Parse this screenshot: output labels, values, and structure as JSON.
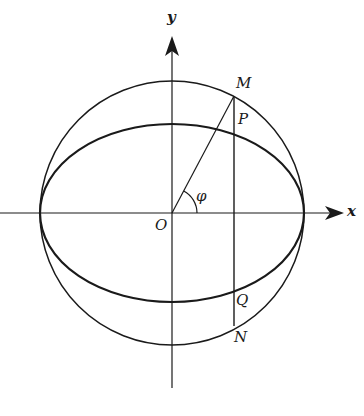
{
  "figure": {
    "colors": {
      "ink": "#1a1a1a",
      "background": "#ffffff"
    },
    "geometry": {
      "origin": [
        172,
        213
      ],
      "circle_radius": 132,
      "ellipse_a": 132,
      "ellipse_b": 89,
      "vertical_line_x": 234
    }
  },
  "labels": {
    "y_axis": "y",
    "x_axis": "x",
    "origin": "O",
    "angle": "φ",
    "M": "M",
    "P": "P",
    "Q": "Q",
    "N": "N"
  }
}
